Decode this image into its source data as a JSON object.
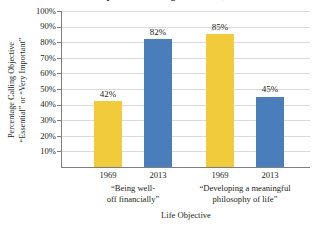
{
  "chart_data": {
    "type": "bar",
    "title": "Life Objectives of College Freshmen, 1969-2013",
    "xlabel": "Life Objective",
    "ylabel": "Percentage Calling Objective \"Essential\" or \"Very Important\"",
    "ylabel_lines": [
      "Percentage Calling Objective",
      "“Essential” or “Very Important”"
    ],
    "categories": [
      "1969",
      "2013",
      "1969",
      "2013"
    ],
    "values": [
      42,
      82,
      85,
      45
    ],
    "value_labels": [
      "42%",
      "82%",
      "85%",
      "45%"
    ],
    "bar_colors": [
      "#F2CB3C",
      "#4A7EBB",
      "#F2CB3C",
      "#4A7EBB"
    ],
    "groups": [
      {
        "lines": [
          "“Being well-",
          "off financially”"
        ],
        "categories": [
          "1969",
          "2013"
        ],
        "values": [
          42,
          82
        ]
      },
      {
        "lines": [
          "“Developing a meaningful",
          "philosophy of life”"
        ],
        "categories": [
          "1969",
          "2013"
        ],
        "values": [
          85,
          45
        ]
      }
    ],
    "ylim": [
      0,
      100
    ],
    "yticks": [
      100,
      90,
      80,
      70,
      60,
      50,
      40,
      30,
      20,
      10
    ],
    "ytick_labels": [
      "100%",
      "90%",
      "80%",
      "70%",
      "60%",
      "50%",
      "40%",
      "30%",
      "20%",
      "10%"
    ],
    "grid": true,
    "legend": "none",
    "colors": {
      "series_1969": "#F2CB3C",
      "series_2013": "#4A7EBB",
      "gridline": "#D9D9D9",
      "axis": "#7F7F7F",
      "text": "#231F20",
      "background": "#FFFFFF"
    }
  }
}
